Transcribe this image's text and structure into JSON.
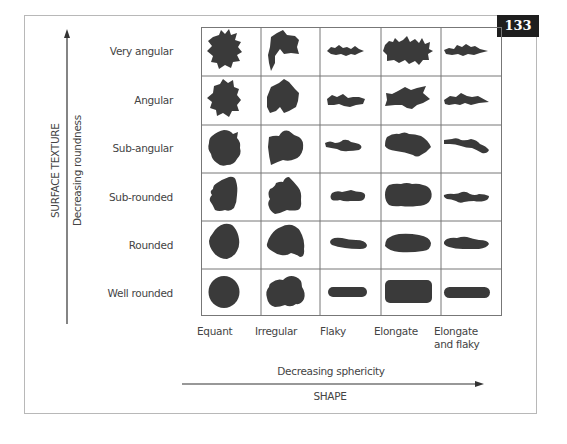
{
  "badge": {
    "number": "133"
  },
  "y_axis": {
    "title": "SURFACE TEXTURE",
    "subtitle": "Decreasing roundness"
  },
  "x_axis": {
    "title": "SHAPE",
    "subtitle": "Decreasing sphericity"
  },
  "rows": [
    {
      "label": "Very angular"
    },
    {
      "label": "Angular"
    },
    {
      "label": "Sub-angular"
    },
    {
      "label": "Sub-rounded"
    },
    {
      "label": "Rounded"
    },
    {
      "label": "Well rounded"
    }
  ],
  "columns": [
    {
      "label": "Equant",
      "label2": ""
    },
    {
      "label": "Irregular",
      "label2": ""
    },
    {
      "label": "Flaky",
      "label2": ""
    },
    {
      "label": "Elongate",
      "label2": ""
    },
    {
      "label": "Elongate",
      "label2": "and flaky"
    }
  ],
  "colors": {
    "shape_fill": "#3a3a3a",
    "grid_line": "#777777",
    "frame_border": "#b8b8b8",
    "text": "#444444",
    "badge_bg": "#1e1e1e",
    "badge_text": "#ffffff"
  }
}
